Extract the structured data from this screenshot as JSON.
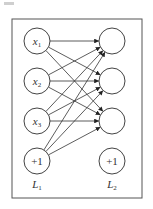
{
  "diagram": {
    "frame": {
      "x": 12,
      "y": 19,
      "w": 130,
      "h": 179,
      "stroke": "#555555"
    },
    "node_radius": 13,
    "node_stroke": "#444444",
    "edge_stroke": "#333333",
    "layers": [
      {
        "label": "L",
        "subscript": "1",
        "x": 37,
        "label_y": 188,
        "nodes": [
          {
            "id": "x1",
            "text": "x",
            "sub": "1",
            "y": 41,
            "italic": true
          },
          {
            "id": "x2",
            "text": "x",
            "sub": "2",
            "y": 81,
            "italic": true
          },
          {
            "id": "x3",
            "text": "x",
            "sub": "3",
            "y": 121,
            "italic": true
          },
          {
            "id": "b1",
            "text": "+1",
            "sub": "",
            "y": 161,
            "italic": false
          }
        ]
      },
      {
        "label": "L",
        "subscript": "2",
        "x": 112,
        "label_y": 188,
        "nodes": [
          {
            "id": "h1",
            "text": "",
            "sub": "",
            "y": 41,
            "italic": false
          },
          {
            "id": "h2",
            "text": "",
            "sub": "",
            "y": 81,
            "italic": false
          },
          {
            "id": "h3",
            "text": "",
            "sub": "",
            "y": 121,
            "italic": false
          },
          {
            "id": "b2",
            "text": "+1",
            "sub": "",
            "y": 161,
            "italic": false
          }
        ]
      }
    ],
    "edges": [
      [
        "x1",
        "h1"
      ],
      [
        "x1",
        "h2"
      ],
      [
        "x1",
        "h3"
      ],
      [
        "x2",
        "h1"
      ],
      [
        "x2",
        "h2"
      ],
      [
        "x2",
        "h3"
      ],
      [
        "x3",
        "h1"
      ],
      [
        "x3",
        "h2"
      ],
      [
        "x3",
        "h3"
      ],
      [
        "b1",
        "h1"
      ],
      [
        "b1",
        "h2"
      ],
      [
        "b1",
        "h3"
      ]
    ]
  }
}
